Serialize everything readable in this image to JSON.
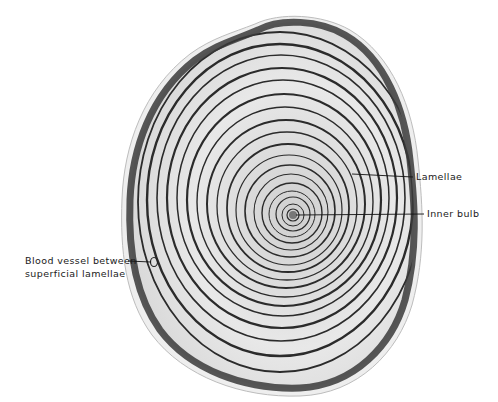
{
  "figure": {
    "labels": {
      "lamellae": "Lamellae",
      "inner_bulb": "Inner bulb",
      "blood_vessel_line1": "Blood vessel between",
      "blood_vessel_line2": "superficial lamellae"
    },
    "colors": {
      "background": "#ffffff",
      "capsule_dark": "#3a3a3a",
      "lamella_line": "#2b2b2b",
      "lamella_fill": "#e6e6e6",
      "label_text": "#1a1a1a"
    }
  }
}
